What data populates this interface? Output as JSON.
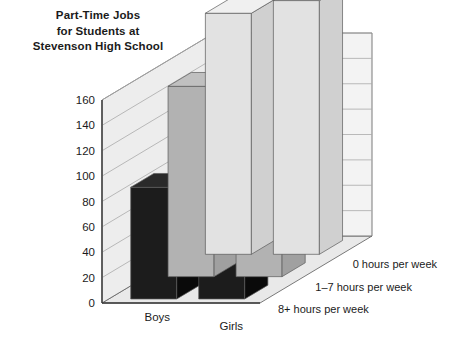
{
  "chart_data": {
    "type": "bar",
    "title": "Part-Time Jobs for Students at Stevenson High School",
    "title_lines": [
      "Part-Time Jobs",
      "for Students at",
      "Stevenson High School"
    ],
    "render": "3d-grouped-bar",
    "categories": [
      "Boys",
      "Girls"
    ],
    "series": [
      {
        "name": "0 hours per week",
        "values": [
          190,
          200
        ],
        "color": "#e2e2e2",
        "clipped_above_axis": true
      },
      {
        "name": "1–7 hours per week",
        "values": [
          150,
          148
        ],
        "color": "#b2b2b2"
      },
      {
        "name": "8+ hours per week",
        "values": [
          88,
          138
        ],
        "color": "#1c1c1c"
      }
    ],
    "xlabel": "",
    "ylabel": "",
    "ylim": [
      0,
      160
    ],
    "yticks": [
      0,
      20,
      40,
      60,
      80,
      100,
      120,
      140,
      160
    ],
    "ytick_labels": [
      "0",
      "20",
      "40",
      "60",
      "80",
      "100",
      "120",
      "140",
      "160"
    ],
    "grid": true,
    "legend_position": "depth-axis-right",
    "colors": {
      "background": "#ffffff",
      "wall": "#ececec",
      "floor": "#e8e8e8",
      "gridline": "#a9a9a9",
      "axis": "#3a3a3a",
      "text": "#1b1b1b"
    }
  }
}
